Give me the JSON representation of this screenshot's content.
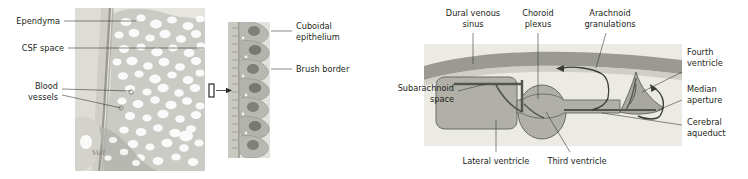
{
  "figure": {
    "background_color": "#ffffff",
    "text_color": "#231f20",
    "leader_color": "#3b3a38"
  },
  "left_panel": {
    "name": "choroid-plexus-micrograph",
    "signature": "Voll",
    "labels": {
      "ependyma": "Ependyma",
      "csf_space": "CSF space",
      "blood_vessels_line1": "Blood",
      "blood_vessels_line2": "vessels",
      "cuboidal_line1": "Cuboidal",
      "cuboidal_line2": "epithelium",
      "brush_border": "Brush border"
    },
    "micrograph": {
      "tissue_tone": "#b9bbb4",
      "villi_tone": "#a9aca4",
      "stroma_tone": "#d8d8d2",
      "inset_cell_count": 7,
      "inset_nucleus_tone": "#7e8079"
    }
  },
  "right_panel": {
    "name": "csf-circulation-diagram",
    "labels": {
      "dural_sinus_line1": "Dural venous",
      "dural_sinus_line2": "sinus",
      "choroid_plexus_line1": "Choroid",
      "choroid_plexus_line2": "plexus",
      "arachnoid_line1": "Arachnoid",
      "arachnoid_line2": "granulations",
      "fourth_ventricle_line1": "Fourth",
      "fourth_ventricle_line2": "ventricle",
      "median_aperture_line1": "Median",
      "median_aperture_line2": "aperture",
      "cerebral_aqueduct_line1": "Cerebral",
      "cerebral_aqueduct_line2": "aqueduct",
      "subarachnoid_line1": "Subarachnoid",
      "subarachnoid_line2": "space",
      "lateral_ventricle": "Lateral ventricle",
      "third_ventricle": "Third ventricle"
    },
    "colors": {
      "field": "#eceae4",
      "dura": "#9a9a93",
      "ventricle_fill": "#b0b0a9",
      "ventricle_stroke": "#6a6a64",
      "plexus_stroke": "#55554f",
      "arrow": "#3a3a36"
    }
  }
}
